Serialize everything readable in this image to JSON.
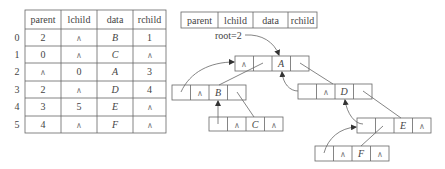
{
  "table": {
    "headers": [
      "parent",
      "lchild",
      "data",
      "rchild"
    ],
    "rows": [
      {
        "index": "0",
        "parent": "2",
        "lchild": "∧",
        "data": "B",
        "rchild": "1"
      },
      {
        "index": "1",
        "parent": "0",
        "lchild": "∧",
        "data": "C",
        "rchild": "∧"
      },
      {
        "index": "2",
        "parent": "∧",
        "lchild": "0",
        "data": "A",
        "rchild": "3"
      },
      {
        "index": "3",
        "parent": "2",
        "lchild": "∧",
        "data": "D",
        "rchild": "4"
      },
      {
        "index": "4",
        "parent": "3",
        "lchild": "5",
        "data": "E",
        "rchild": "∧"
      },
      {
        "index": "5",
        "parent": "4",
        "lchild": "∧",
        "data": "F",
        "rchild": "∧"
      }
    ]
  },
  "legend": {
    "fields": [
      "parent",
      "lchild",
      "data",
      "rchild"
    ]
  },
  "root_label": "root=2",
  "null_symbol": "∧",
  "nodes": {
    "A": {
      "parent": "",
      "lchild": "∧",
      "data": "A",
      "rchild": ""
    },
    "B": {
      "parent": "",
      "lchild": "∧",
      "data": "B",
      "rchild": ""
    },
    "C": {
      "parent": "",
      "lchild": "∧",
      "data": "C",
      "rchild": "∧"
    },
    "D": {
      "parent": "",
      "lchild": "∧",
      "data": "D",
      "rchild": ""
    },
    "E": {
      "parent": "",
      "lchild": "",
      "data": "E",
      "rchild": "∧"
    },
    "F": {
      "parent": "",
      "lchild": "∧",
      "data": "F",
      "rchild": "∧"
    }
  }
}
